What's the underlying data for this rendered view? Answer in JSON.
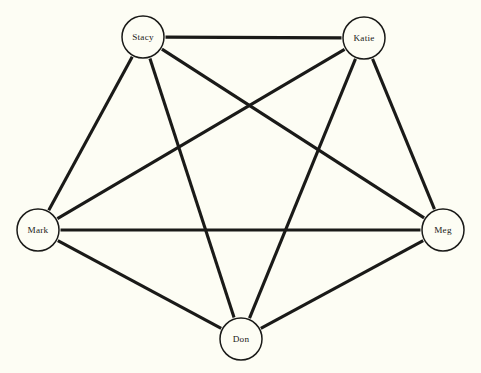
{
  "figure": {
    "background_color": "#fdfdf4",
    "line_color": "#1a1a18",
    "node_fill_color": "#fdfdf4"
  },
  "chart_data": {
    "type": "diagram",
    "subtype": "node-link-network-graph",
    "title": "",
    "xlabel": "",
    "ylabel": "",
    "grid": false,
    "legend": false,
    "directed": false,
    "node_count": 5,
    "edge_count": 10,
    "complete_graph": true,
    "nodes": [
      {
        "id": "stacy",
        "label": "Stacy",
        "x": 143,
        "y": 37,
        "r": 21,
        "degree": 4
      },
      {
        "id": "katie",
        "label": "Katie",
        "x": 364,
        "y": 38,
        "r": 21,
        "degree": 4
      },
      {
        "id": "mark",
        "label": "Mark",
        "x": 38,
        "y": 230,
        "r": 21,
        "degree": 4
      },
      {
        "id": "meg",
        "label": "Meg",
        "x": 443,
        "y": 230,
        "r": 21,
        "degree": 4
      },
      {
        "id": "don",
        "label": "Don",
        "x": 241,
        "y": 339,
        "r": 21,
        "degree": 4
      }
    ],
    "edges": [
      {
        "source": "stacy",
        "target": "katie"
      },
      {
        "source": "stacy",
        "target": "mark"
      },
      {
        "source": "stacy",
        "target": "meg"
      },
      {
        "source": "stacy",
        "target": "don"
      },
      {
        "source": "katie",
        "target": "mark"
      },
      {
        "source": "katie",
        "target": "meg"
      },
      {
        "source": "katie",
        "target": "don"
      },
      {
        "source": "mark",
        "target": "meg"
      },
      {
        "source": "mark",
        "target": "don"
      },
      {
        "source": "meg",
        "target": "don"
      }
    ]
  }
}
